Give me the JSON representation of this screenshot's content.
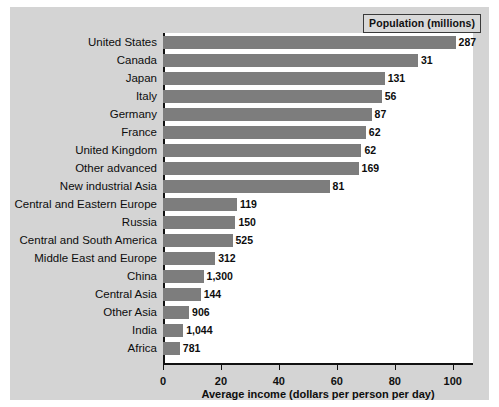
{
  "legend": {
    "title": "Population (millions)"
  },
  "chart_data": {
    "type": "bar",
    "orientation": "horizontal",
    "title": "",
    "xlabel": "Average income (dollars per person per day)",
    "ylabel": "",
    "xlim": [
      0,
      107
    ],
    "xticks": [
      0,
      20,
      40,
      60,
      80,
      100
    ],
    "xticklabels": [
      "0",
      "20",
      "40",
      "60",
      "80",
      "100"
    ],
    "grid": false,
    "legend_position": "top-right",
    "bar_color": "#7d7d7d",
    "series_label": "Population (millions)",
    "categories": [
      "United States",
      "Canada",
      "Japan",
      "Italy",
      "Germany",
      "France",
      "United Kingdom",
      "Other advanced",
      "New industrial Asia",
      "Central and Eastern Europe",
      "Russia",
      "Central and South America",
      "Middle East and Europe",
      "China",
      "Central Asia",
      "Other Asia",
      "India",
      "Africa"
    ],
    "values": [
      101,
      88,
      76.5,
      75.5,
      72,
      70,
      68.5,
      67.5,
      57.5,
      25.5,
      25,
      24,
      18,
      14,
      13,
      9,
      7,
      5.8
    ],
    "point_labels": [
      "287",
      "31",
      "131",
      "56",
      "87",
      "62",
      "62",
      "169",
      "81",
      "119",
      "150",
      "525",
      "312",
      "1,300",
      "144",
      "906",
      "1,044",
      "781"
    ]
  }
}
